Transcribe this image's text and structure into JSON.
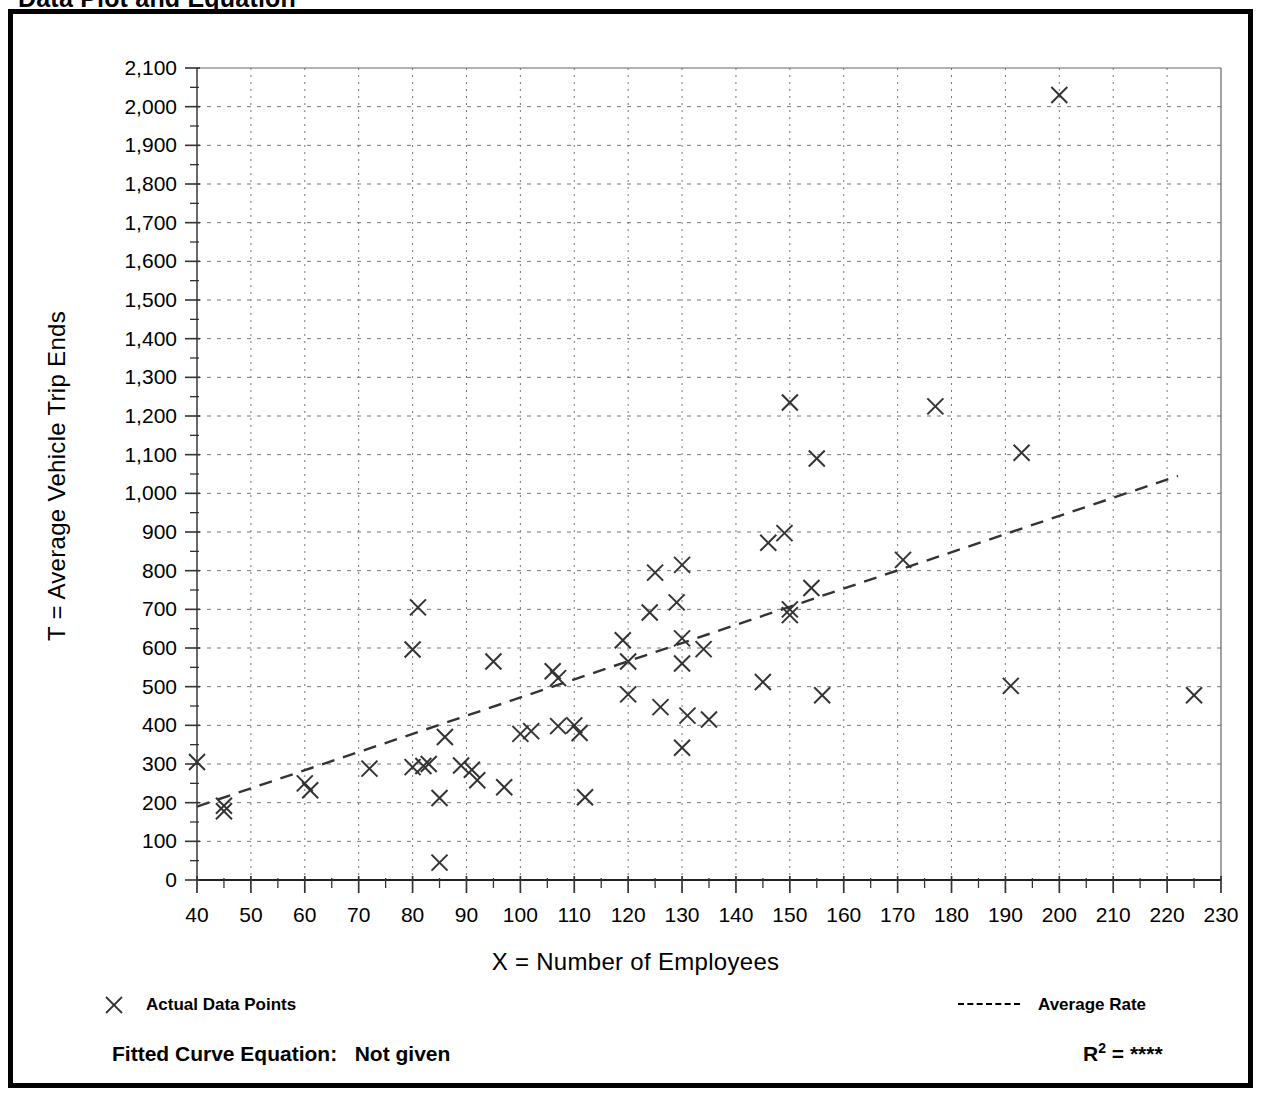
{
  "figure": {
    "title": "Data Plot and Equation"
  },
  "chart_data": {
    "type": "scatter",
    "title": "Data Plot and Equation",
    "xlabel": "X = Number of Employees",
    "ylabel": "T = Average Vehicle Trip Ends",
    "xlim": [
      40,
      230
    ],
    "ylim": [
      0,
      2100
    ],
    "x_major_step": 10,
    "x_minor_step": 5,
    "y_major_step": 100,
    "y_minor_step": 50,
    "grid": true,
    "grid_style": "dotted",
    "legend_position": "below-axes",
    "x_ticks": [
      40,
      50,
      60,
      70,
      80,
      90,
      100,
      110,
      120,
      130,
      140,
      150,
      160,
      170,
      180,
      190,
      200,
      210,
      220,
      230
    ],
    "y_ticks": [
      0,
      100,
      200,
      300,
      400,
      500,
      600,
      700,
      800,
      900,
      1000,
      1100,
      1200,
      1300,
      1400,
      1500,
      1600,
      1700,
      1800,
      1900,
      2000,
      2100
    ],
    "y_tick_labels": [
      "0",
      "100",
      "200",
      "300",
      "400",
      "500",
      "600",
      "700",
      "800",
      "900",
      "1,000",
      "1,100",
      "1,200",
      "1,300",
      "1,400",
      "1,500",
      "1,600",
      "1,700",
      "1,800",
      "1,900",
      "2,000",
      "2,100"
    ],
    "series": [
      {
        "name": "Actual Data Points",
        "type": "scatter",
        "marker": "x",
        "color": "#333333",
        "points": [
          [
            40,
            305
          ],
          [
            45,
            192
          ],
          [
            45,
            178
          ],
          [
            60,
            250
          ],
          [
            61,
            232
          ],
          [
            72,
            288
          ],
          [
            80,
            596
          ],
          [
            80,
            292
          ],
          [
            81,
            705
          ],
          [
            82,
            295
          ],
          [
            83,
            300
          ],
          [
            85,
            45
          ],
          [
            85,
            212
          ],
          [
            86,
            370
          ],
          [
            89,
            296
          ],
          [
            91,
            285
          ],
          [
            92,
            258
          ],
          [
            95,
            565
          ],
          [
            97,
            240
          ],
          [
            100,
            378
          ],
          [
            102,
            385
          ],
          [
            106,
            540
          ],
          [
            107,
            522
          ],
          [
            107,
            398
          ],
          [
            110,
            400
          ],
          [
            111,
            380
          ],
          [
            112,
            214
          ],
          [
            119,
            620
          ],
          [
            120,
            565
          ],
          [
            120,
            480
          ],
          [
            124,
            692
          ],
          [
            125,
            795
          ],
          [
            126,
            447
          ],
          [
            129,
            718
          ],
          [
            130,
            625
          ],
          [
            130,
            815
          ],
          [
            130,
            560
          ],
          [
            130,
            342
          ],
          [
            131,
            425
          ],
          [
            134,
            597
          ],
          [
            135,
            415
          ],
          [
            145,
            512
          ],
          [
            146,
            872
          ],
          [
            149,
            897
          ],
          [
            150,
            700
          ],
          [
            150,
            685
          ],
          [
            150,
            1235
          ],
          [
            154,
            755
          ],
          [
            155,
            1090
          ],
          [
            156,
            478
          ],
          [
            171,
            828
          ],
          [
            177,
            1225
          ],
          [
            191,
            502
          ],
          [
            193,
            1105
          ],
          [
            200,
            2030
          ],
          [
            225,
            478
          ]
        ]
      },
      {
        "name": "Average Rate",
        "type": "line",
        "style": "dashed",
        "color": "#333333",
        "points": [
          [
            40,
            190
          ],
          [
            222,
            1045
          ]
        ]
      }
    ]
  },
  "legend": {
    "actual_points_label": "Actual Data Points",
    "average_rate_label": "Average Rate"
  },
  "equation": {
    "fitted_curve_label": "Fitted Curve Equation:",
    "fitted_curve_value": "Not given",
    "r_squared_label": "R",
    "r_squared_exponent": "2",
    "r_squared_equals": "=",
    "r_squared_value": "****"
  }
}
